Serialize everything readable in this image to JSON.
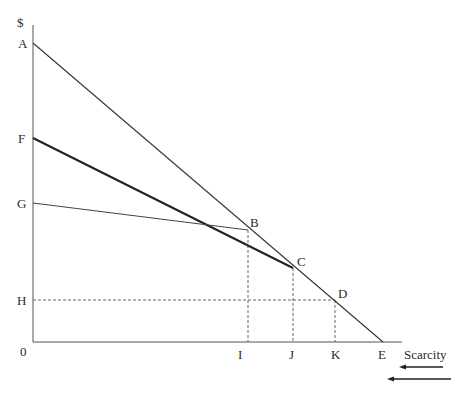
{
  "diagram": {
    "y_axis_label": "$",
    "x_axis_label": "Scarcity",
    "origin_label": "0",
    "y_labels": {
      "A": "A",
      "F": "F",
      "G": "G",
      "H": "H"
    },
    "x_labels": {
      "I": "I",
      "J": "J",
      "K": "K",
      "E": "E"
    },
    "point_labels": {
      "B": "B",
      "C": "C",
      "D": "D"
    },
    "lines": [
      {
        "name": "A-E",
        "from": "A",
        "to": "E",
        "style": "thin solid"
      },
      {
        "name": "F-C",
        "from": "F",
        "to": "C",
        "style": "thick solid"
      },
      {
        "name": "G-B",
        "from": "G",
        "to": "B",
        "style": "thin solid"
      },
      {
        "name": "H-D",
        "from": "H",
        "to": "D",
        "style": "dashed"
      },
      {
        "name": "B-I",
        "from": "B",
        "to": "I",
        "style": "dashed"
      },
      {
        "name": "C-J",
        "from": "C",
        "to": "J",
        "style": "dashed"
      },
      {
        "name": "D-K",
        "from": "D",
        "to": "K",
        "style": "dashed"
      }
    ],
    "arrows": [
      {
        "direction": "left",
        "length": "short"
      },
      {
        "direction": "left",
        "length": "long"
      }
    ]
  }
}
